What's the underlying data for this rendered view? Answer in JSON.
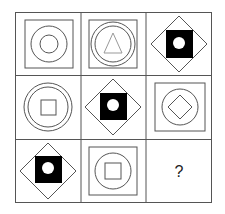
{
  "puzzle": {
    "grid": {
      "rows": 3,
      "cols": 3,
      "x": 15,
      "y": 12,
      "width": 197,
      "height": 191,
      "line_color": "#555555"
    },
    "cells": [
      {
        "row": 0,
        "col": 0,
        "shapes": [
          "outer-square",
          "large-circle",
          "small-circle"
        ]
      },
      {
        "row": 0,
        "col": 1,
        "shapes": [
          "outer-square",
          "large-circle",
          "inner-circle",
          "triangle"
        ]
      },
      {
        "row": 0,
        "col": 2,
        "shapes": [
          "diamond",
          "black-square",
          "white-circle"
        ]
      },
      {
        "row": 1,
        "col": 0,
        "shapes": [
          "outer-square",
          "large-circle",
          "inner-circle",
          "small-square"
        ]
      },
      {
        "row": 1,
        "col": 1,
        "shapes": [
          "diamond",
          "black-square",
          "white-circle"
        ]
      },
      {
        "row": 1,
        "col": 2,
        "shapes": [
          "outer-square",
          "circle",
          "small-diamond"
        ]
      },
      {
        "row": 2,
        "col": 0,
        "shapes": [
          "diamond",
          "black-square",
          "white-circle"
        ]
      },
      {
        "row": 2,
        "col": 1,
        "shapes": [
          "outer-square",
          "circle",
          "small-square"
        ]
      },
      {
        "row": 2,
        "col": 2,
        "shapes": [],
        "label": "?"
      }
    ],
    "question_mark": "?",
    "colors": {
      "stroke": "#555555",
      "fill_black": "#000000",
      "triangle_stroke": "#999999",
      "background": "#ffffff"
    }
  }
}
